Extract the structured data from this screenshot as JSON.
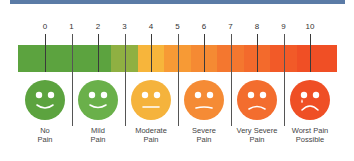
{
  "banner_color": "#5b7ba6",
  "scale": {
    "ticks": [
      "0",
      "1",
      "2",
      "3",
      "4",
      "5",
      "6",
      "7",
      "8",
      "9",
      "10"
    ],
    "segment_colors": [
      "#5ca33f",
      "#5ca33f",
      "#5ca33f",
      "#8fb042",
      "#f7b53b",
      "#f79a35",
      "#f58a33",
      "#f4772f",
      "#f36a2c",
      "#f25a28",
      "#f04f25"
    ]
  },
  "faces": [
    {
      "label_line1": "No",
      "label_line2": "Pain",
      "expression": "big-smile",
      "color": "#5ca33f",
      "icon": "very-happy-face-icon"
    },
    {
      "label_line1": "Mild",
      "label_line2": "Pain",
      "expression": "smile",
      "color": "#6ab04a",
      "icon": "happy-face-icon"
    },
    {
      "label_line1": "Moderate",
      "label_line2": "Pain",
      "expression": "neutral",
      "color": "#f5b33c",
      "icon": "neutral-face-icon"
    },
    {
      "label_line1": "Severe",
      "label_line2": "Pain",
      "expression": "slight-frown",
      "color": "#f58b35",
      "icon": "uneasy-face-icon"
    },
    {
      "label_line1": "Very Severe",
      "label_line2": "Pain",
      "expression": "frown",
      "color": "#f36d2e",
      "icon": "sad-face-icon"
    },
    {
      "label_line1": "Worst Pain",
      "label_line2": "Possible",
      "expression": "crying",
      "color": "#ef4f25",
      "icon": "crying-face-icon"
    }
  ],
  "chart_data": {
    "type": "scale",
    "title": "",
    "range": [
      0,
      10
    ],
    "ticks": [
      0,
      1,
      2,
      3,
      4,
      5,
      6,
      7,
      8,
      9,
      10
    ],
    "categories": [
      {
        "value": 0,
        "label": "No Pain"
      },
      {
        "value": 2,
        "label": "Mild Pain"
      },
      {
        "value": 4,
        "label": "Moderate Pain"
      },
      {
        "value": 6,
        "label": "Severe Pain"
      },
      {
        "value": 8,
        "label": "Very Severe Pain"
      },
      {
        "value": 10,
        "label": "Worst Pain Possible"
      }
    ],
    "gradient": "green to red"
  }
}
